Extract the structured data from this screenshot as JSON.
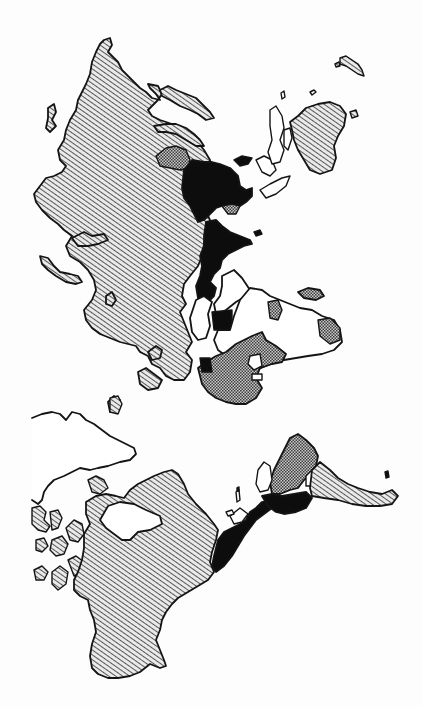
{
  "map": {
    "type": "world-map-rotated",
    "style": "monochrome hatched thematic map",
    "background_color": "#ffffff",
    "outline_color": "#141414",
    "legend": [],
    "labels": [],
    "fill_classes": [
      {
        "id": "diagonal-hatch",
        "description": "light diagonal line hatching",
        "color": "#3a3a3a"
      },
      {
        "id": "cross-hatch",
        "description": "dense cross-hatched / checker texture",
        "color": "#505050"
      },
      {
        "id": "solid-black",
        "description": "solid black fill",
        "color": "#0d0d0d"
      },
      {
        "id": "white",
        "description": "unfilled / white with outline only",
        "color": "#ffffff"
      }
    ],
    "regions": [
      {
        "name": "eurasia-west-north",
        "fill": "diagonal-hatch"
      },
      {
        "name": "east-asia-block",
        "fill": "solid-black"
      },
      {
        "name": "central-asia-patch",
        "fill": "cross-hatch"
      },
      {
        "name": "middle-east-strip",
        "fill": "solid-black"
      },
      {
        "name": "africa-north",
        "fill": "white"
      },
      {
        "name": "africa-south",
        "fill": "cross-hatch"
      },
      {
        "name": "arabia",
        "fill": "white"
      },
      {
        "name": "madagascar",
        "fill": "cross-hatch"
      },
      {
        "name": "australia",
        "fill": "diagonal-hatch"
      },
      {
        "name": "new-zealand",
        "fill": "white"
      },
      {
        "name": "southeast-asia-islands",
        "fill": "white"
      },
      {
        "name": "greenland",
        "fill": "white"
      },
      {
        "name": "north-america",
        "fill": "diagonal-hatch"
      },
      {
        "name": "canadian-arctic-islands",
        "fill": "diagonal-hatch"
      },
      {
        "name": "central-america",
        "fill": "solid-black"
      },
      {
        "name": "south-america-north",
        "fill": "solid-black"
      },
      {
        "name": "south-america-brazil",
        "fill": "cross-hatch"
      },
      {
        "name": "south-america-south",
        "fill": "diagonal-hatch"
      }
    ]
  }
}
